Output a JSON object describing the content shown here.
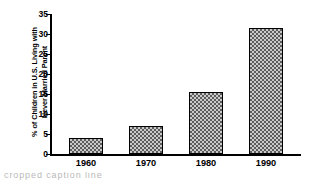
{
  "chart_data": {
    "type": "bar",
    "title": "",
    "xlabel": "",
    "ylabel": "% of Children in U.S. Living with\nNever Married Parent",
    "categories": [
      "1960",
      "1970",
      "1980",
      "1990"
    ],
    "values": [
      4,
      7,
      15.5,
      31.5
    ],
    "ylim": [
      0,
      35
    ],
    "yticks": [
      0,
      5,
      10,
      15,
      20,
      25,
      30,
      35
    ],
    "ytick_labels": [
      "0",
      "5",
      "10",
      "15",
      "20",
      "25",
      "30",
      "35"
    ],
    "grid": false,
    "legend": "none",
    "bar_fill": "checkerboard-hatch",
    "bar_edge_color": "#000000",
    "bar_fill_color": "#8a8a8a",
    "background_color": "#ffffff",
    "text_color": "#000000"
  },
  "caption": {
    "fragment": "cropped caption line"
  }
}
